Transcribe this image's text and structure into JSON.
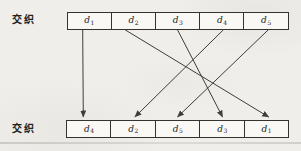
{
  "diagram": {
    "left_labels": {
      "top": "交织",
      "bottom": "交织"
    },
    "top_row": {
      "cells": [
        {
          "base": "d",
          "sub": "1"
        },
        {
          "base": "d",
          "sub": "2"
        },
        {
          "base": "d",
          "sub": "3"
        },
        {
          "base": "d",
          "sub": "4"
        },
        {
          "base": "d",
          "sub": "5"
        }
      ]
    },
    "bottom_row": {
      "cells": [
        {
          "base": "d",
          "sub": "4"
        },
        {
          "base": "d",
          "sub": "2"
        },
        {
          "base": "d",
          "sub": "5"
        },
        {
          "base": "d",
          "sub": "3"
        },
        {
          "base": "d",
          "sub": "1"
        }
      ]
    },
    "arrows": [
      {
        "from": "d1",
        "from_slot": 1,
        "to_slot": 1
      },
      {
        "from": "d2",
        "from_slot": 2,
        "to_slot": 5
      },
      {
        "from": "d3",
        "from_slot": 3,
        "to_slot": 4
      },
      {
        "from": "d4",
        "from_slot": 4,
        "to_slot": 2
      },
      {
        "from": "d5",
        "from_slot": 5,
        "to_slot": 3
      }
    ],
    "colors": {
      "background": "#efeeea",
      "box_fill": "#f9f8f4",
      "box_border": "#35332f",
      "arrow": "#3f3d3a",
      "label_text": "#232323"
    }
  }
}
